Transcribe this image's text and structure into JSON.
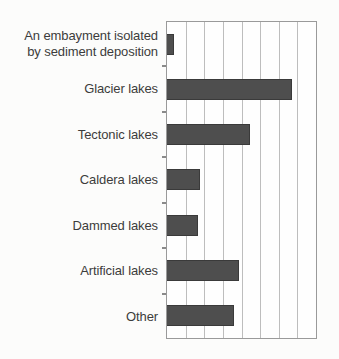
{
  "chart_data": {
    "type": "bar",
    "orientation": "horizontal",
    "title": "",
    "xlabel": "",
    "ylabel": "",
    "categories": [
      "An embayment isolated\nby sediment deposition",
      "Glacier lakes",
      "Tectonic lakes",
      "Caldera lakes",
      "Dammed lakes",
      "Artificial lakes",
      "Other"
    ],
    "values": [
      0.37,
      6.72,
      4.43,
      1.78,
      1.64,
      3.86,
      3.59
    ],
    "value_units": "gridline intervals (axis has no numeric labels)",
    "xlim": [
      0,
      8
    ],
    "grid": true,
    "gridline_count": 9,
    "legend_visible": false,
    "axis_tick_marks": "short ticks on left axis between category rows",
    "colors": {
      "bar": "#4e4e4e",
      "bar_edge": "#3a3a3a",
      "grid": "#bdbdbd",
      "frame": "#9a9a9a",
      "tick": "#8a8a8a",
      "label_text": "#3c3c3c",
      "background": "#fcfcfb"
    }
  }
}
